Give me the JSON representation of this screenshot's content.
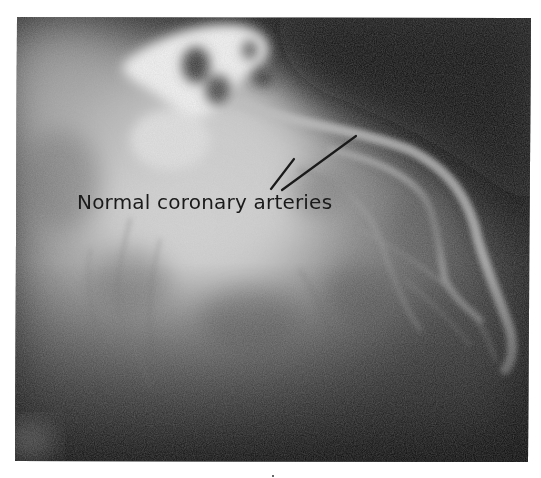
{
  "figure": {
    "type": "coronary angiogram",
    "annotation": {
      "label": "Normal coronary arteries",
      "pointer_count": 2
    },
    "colors": {
      "background": "#ffffff",
      "film_dark": "#111111",
      "film_mid": "#7a7a7a",
      "film_bright": "#e8e8e8",
      "label_text": "#1a1a1a",
      "pointer_line": "#1a1a1a"
    }
  }
}
